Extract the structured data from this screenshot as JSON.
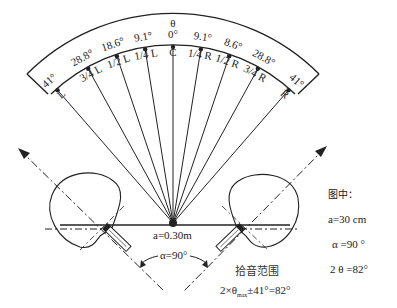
{
  "diagram": {
    "theta_label": "θ",
    "center_label": "a=0.30m",
    "alpha_label": "α=90°",
    "pickup_title": "拾音范围",
    "pickup_formula_prefix": "2×θ",
    "pickup_formula_sub": "max",
    "pickup_formula_suffix": "±41°=82°",
    "positions": [
      {
        "name": "L",
        "angle_label": "41°",
        "deg": -41
      },
      {
        "name": "3/4 L",
        "angle_label": "28.8°",
        "deg": -28.8
      },
      {
        "name": "1/2 L",
        "angle_label": "18.6°",
        "deg": -18.6
      },
      {
        "name": "1/4 L",
        "angle_label": "9.1°",
        "deg": -9.1
      },
      {
        "name": "C",
        "angle_label": "0°",
        "deg": 0
      },
      {
        "name": "1/4 R",
        "angle_label": "9.1°",
        "deg": 9.1
      },
      {
        "name": "1/2 R",
        "angle_label": "8.6°",
        "deg": 18.6
      },
      {
        "name": "3/4 R",
        "angle_label": "28.8°",
        "deg": 28.8
      },
      {
        "name": "R",
        "angle_label": "41°",
        "deg": 41
      }
    ]
  },
  "legend": {
    "title": "图中：",
    "a": "a=30 cm",
    "alpha": "α =90 °",
    "theta": "2 θ =82°"
  }
}
